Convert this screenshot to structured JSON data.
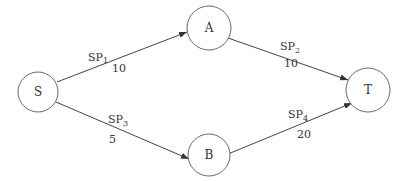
{
  "diagram": {
    "type": "directed-network",
    "nodes": [
      {
        "id": "S",
        "label": "S",
        "cx": 38,
        "cy": 92,
        "r": 20
      },
      {
        "id": "A",
        "label": "A",
        "cx": 209,
        "cy": 28,
        "r": 22
      },
      {
        "id": "B",
        "label": "B",
        "cx": 209,
        "cy": 155,
        "r": 21
      },
      {
        "id": "T",
        "label": "T",
        "cx": 368,
        "cy": 90,
        "r": 22
      }
    ],
    "edges": [
      {
        "from": "S",
        "to": "A",
        "name": "SP",
        "sub": "1",
        "weight": "10"
      },
      {
        "from": "A",
        "to": "T",
        "name": "SP",
        "sub": "2",
        "weight": "10"
      },
      {
        "from": "S",
        "to": "B",
        "name": "SP",
        "sub": "3",
        "weight": "5"
      },
      {
        "from": "B",
        "to": "T",
        "name": "SP",
        "sub": "4",
        "weight": "20"
      }
    ]
  }
}
